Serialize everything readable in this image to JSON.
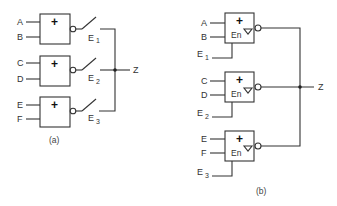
{
  "diagram_a": {
    "caption": "(a)",
    "output_label": "Z",
    "gates": [
      {
        "symbol": "+",
        "inputs": [
          "A",
          "B"
        ],
        "switch_label": "E",
        "switch_sub": "1"
      },
      {
        "symbol": "+",
        "inputs": [
          "C",
          "D"
        ],
        "switch_label": "E",
        "switch_sub": "2"
      },
      {
        "symbol": "+",
        "inputs": [
          "E",
          "F"
        ],
        "switch_label": "E",
        "switch_sub": "3"
      }
    ]
  },
  "diagram_b": {
    "caption": "(b)",
    "output_label": "Z",
    "gates": [
      {
        "symbol": "+",
        "enable_text": "En",
        "tristate_symbol": "▽",
        "inputs": [
          "A",
          "B"
        ],
        "enable_label": "E",
        "enable_sub": "1"
      },
      {
        "symbol": "+",
        "enable_text": "En",
        "tristate_symbol": "▽",
        "inputs": [
          "C",
          "D"
        ],
        "enable_label": "E",
        "enable_sub": "2"
      },
      {
        "symbol": "+",
        "enable_text": "En",
        "tristate_symbol": "▽",
        "inputs": [
          "E",
          "F"
        ],
        "enable_label": "E",
        "enable_sub": "3"
      }
    ]
  }
}
